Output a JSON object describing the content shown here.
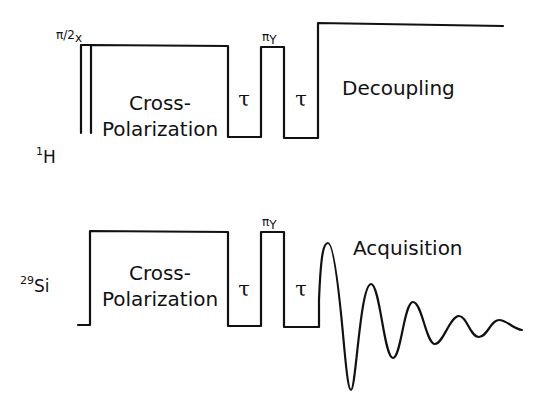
{
  "figure": {
    "type": "NMR pulse sequence diagram",
    "channels": [
      {
        "id": "proton",
        "nucleus_label": "H",
        "nucleus_mass": "1",
        "segments": [
          {
            "name": "pi/2 pulse",
            "label": "π/2",
            "phase": "x"
          },
          {
            "name": "cross polarization",
            "label_line1": "Cross-",
            "label_line2": "Polarization"
          },
          {
            "name": "delay",
            "label": "τ"
          },
          {
            "name": "pi pulse",
            "label": "π",
            "phase": "Y"
          },
          {
            "name": "delay",
            "label": "τ"
          },
          {
            "name": "decoupling",
            "label": "Decoupling"
          }
        ]
      },
      {
        "id": "silicon",
        "nucleus_label": "Si",
        "nucleus_mass": "29",
        "segments": [
          {
            "name": "cross polarization",
            "label_line1": "Cross-",
            "label_line2": "Polarization"
          },
          {
            "name": "delay",
            "label": "τ"
          },
          {
            "name": "pi pulse",
            "label": "π",
            "phase": "Y"
          },
          {
            "name": "delay",
            "label": "τ"
          },
          {
            "name": "acquisition",
            "label": "Acquisition"
          }
        ]
      }
    ]
  }
}
